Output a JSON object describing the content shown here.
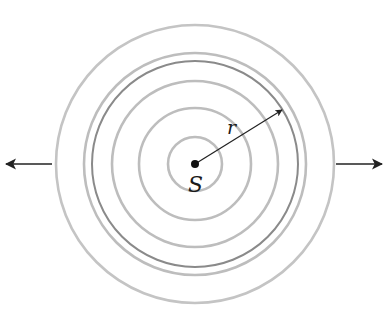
{
  "diagram": {
    "type": "concentric-wavefronts",
    "center": {
      "x": 195,
      "y": 164
    },
    "source_label": "S",
    "radius_label": "r",
    "rings": [
      {
        "r": 27,
        "color": "#bdbdbd",
        "width": 2.6
      },
      {
        "r": 56,
        "color": "#bdbdbd",
        "width": 2.6
      },
      {
        "r": 83,
        "color": "#bdbdbd",
        "width": 2.6
      },
      {
        "r": 103,
        "color": "#8a8a8a",
        "width": 2.0
      },
      {
        "r": 111,
        "color": "#bdbdbd",
        "width": 2.6
      },
      {
        "r": 139,
        "color": "#c4c4c4",
        "width": 2.6
      }
    ],
    "colors": {
      "ink": "#222222",
      "ring": "#bdbdbd",
      "ring_emph": "#8a8a8a"
    },
    "arrows": [
      {
        "name": "left-propagation-arrow",
        "x1": 52,
        "y1": 164,
        "x2": 6,
        "y2": 164
      },
      {
        "name": "right-propagation-arrow",
        "x1": 336,
        "y1": 164,
        "x2": 382,
        "y2": 164
      }
    ],
    "radius_arrow": {
      "x1": 195,
      "y1": 164,
      "x2": 282,
      "y2": 110
    }
  }
}
